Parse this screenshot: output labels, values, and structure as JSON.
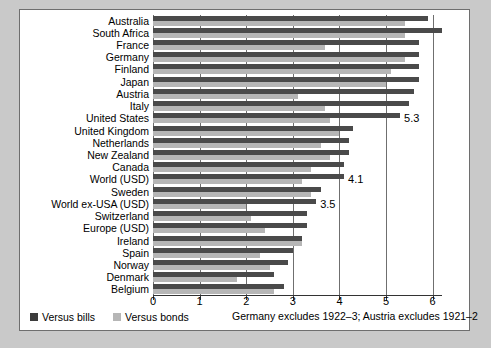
{
  "chart_data": {
    "type": "bar",
    "orientation": "horizontal",
    "title": "",
    "xlabel": "",
    "ylabel": "",
    "xlim": [
      0,
      6.2
    ],
    "xticks": [
      0,
      1,
      2,
      3,
      4,
      5,
      6
    ],
    "xticklabels": [
      "0",
      "1",
      "2",
      "3",
      "4",
      "5",
      "6"
    ],
    "grid": true,
    "grid_axis": "x",
    "legend_position": "bottom-left",
    "categories": [
      "Australia",
      "South Africa",
      "France",
      "Germany",
      "Finland",
      "Japan",
      "Austria",
      "Italy",
      "United States",
      "United Kingdom",
      "Netherlands",
      "New Zealand",
      "Canada",
      "World (USD)",
      "Sweden",
      "World ex-USA (USD)",
      "Switzerland",
      "Europe (USD)",
      "Ireland",
      "Spain",
      "Norway",
      "Denmark",
      "Belgium"
    ],
    "series": [
      {
        "name": "Versus bills",
        "color": "#4a4a4a",
        "values": [
          5.9,
          6.2,
          5.7,
          5.7,
          5.7,
          5.7,
          5.6,
          5.5,
          5.3,
          4.3,
          4.2,
          4.2,
          4.1,
          4.1,
          3.6,
          3.5,
          3.3,
          3.3,
          3.2,
          3.0,
          2.9,
          2.6,
          2.8
        ]
      },
      {
        "name": "Versus bonds",
        "color": "#b6b6b6",
        "values": [
          5.4,
          5.4,
          3.7,
          5.4,
          5.1,
          5.0,
          3.1,
          3.7,
          3.8,
          4.0,
          3.6,
          3.8,
          3.4,
          3.2,
          3.4,
          2.0,
          2.1,
          2.4,
          3.2,
          2.3,
          2.5,
          1.8,
          2.6
        ]
      }
    ],
    "data_labels": [
      {
        "category": "United States",
        "value": "5.3"
      },
      {
        "category": "World (USD)",
        "value": "4.1"
      },
      {
        "category": "World ex-USA (USD)",
        "value": "3.5"
      }
    ],
    "footnote": "Germany excludes 1922–3; Austria excludes 1921–2"
  },
  "legend": {
    "items": [
      {
        "label": "Versus bills",
        "color": "#3c3c3c"
      },
      {
        "label": "Versus bonds",
        "color": "#b6b6b6"
      }
    ]
  },
  "colors": {
    "page_background": "#c9c9c9",
    "panel_background": "#ffffff",
    "panel_border": "#6e6e6e",
    "gridline": "#6f6f6f",
    "axis": "#333333",
    "bills": "#4a4a4a",
    "bonds": "#b6b6b6"
  }
}
